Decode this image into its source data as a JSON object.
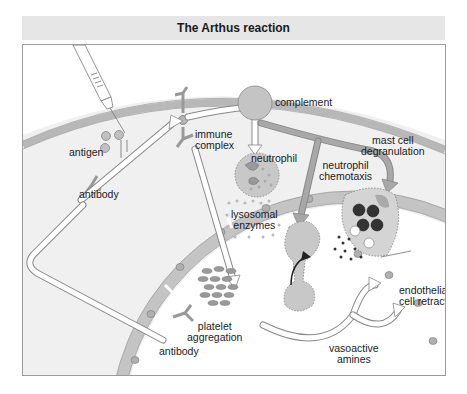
{
  "title": "The Arthus reaction",
  "colors": {
    "tissue": "#f0f0f0",
    "membrane": "#b8b8b8",
    "cell_fill": "#c8c8c8",
    "vessel_lumen": "#ffffff",
    "arrow_gray": "#a8a8a8",
    "granule_dark": "#333333",
    "title_band": "#e6e6e6"
  },
  "labels": {
    "antigen": "antigen",
    "antibody_top": "antibody",
    "immune_complex_1": "immune",
    "immune_complex_2": "complex",
    "complement": "complement",
    "neutrophil": "neutrophil",
    "mast_cell_1": "mast cell",
    "mast_cell_2": "degranulation",
    "chemotaxis_1": "neutrophil",
    "chemotaxis_2": "chemotaxis",
    "lysosomal_1": "lysosomal",
    "lysosomal_2": "enzymes",
    "endothelial_1": "endothelial",
    "endothelial_2": "cell retraction",
    "platelet_1": "platelet",
    "platelet_2": "aggregation",
    "antibody_bottom": "antibody",
    "vasoactive_1": "vasoactive",
    "vasoactive_2": "amines"
  },
  "icons": [
    "syringe-icon",
    "antigen-particle-icon",
    "antibody-icon",
    "immune-complex-icon",
    "complement-icon",
    "neutrophil-icon",
    "mast-cell-icon",
    "platelet-icon",
    "endothelial-cell-icon"
  ]
}
